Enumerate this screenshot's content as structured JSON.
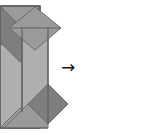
{
  "diagram": {
    "type": "paper-folding-step-diagram",
    "background_color": "#ffffff",
    "arrow": {
      "glyph": "→",
      "label": "folds into",
      "color": "#141414",
      "x": 57,
      "y": 57
    },
    "palette": {
      "light_gray": "#afafaf",
      "mid_gray": "#9a9a9a",
      "dark_gray": "#7e7e7e",
      "edge_stroke": "#6c6c6c",
      "outline_stroke": "#5f5f5f"
    },
    "steps": [
      {
        "id": "before",
        "label": "Unfolded rectangular sheet with top envelope flaps and bottom corner flap",
        "origin_x": 0,
        "origin_y": 0,
        "width": 44,
        "height": 135,
        "shapes": [
          {
            "name": "body-panel",
            "kind": "rect",
            "fill": "#afafaf",
            "points": "0,6 40,6 40,128 0,128"
          },
          {
            "name": "top-left-flap",
            "kind": "triangle",
            "fill": "#9a9a9a",
            "points": "0,6 20,26 0,46"
          },
          {
            "name": "top-right-flap",
            "kind": "triangle",
            "fill": "#9a9a9a",
            "points": "40,6 20,26 40,46"
          },
          {
            "name": "top-upper-flap",
            "kind": "triangle",
            "fill": "#9a9a9a",
            "points": "0,6 40,6 20,26"
          },
          {
            "name": "center-chevron-flap",
            "kind": "chevron",
            "fill": "#7e7e7e",
            "points": "0,6 20,26 40,6 40,42 20,62 0,42"
          },
          {
            "name": "bottom-corner-flap",
            "kind": "triangle",
            "fill": "#9a9a9a",
            "points": "0,128 20,108 40,128"
          }
        ]
      },
      {
        "id": "after",
        "label": "Folded column with diamond head and dark kite foot",
        "origin_x": 75,
        "origin_y": 0,
        "width": 70,
        "height": 135,
        "shapes": [
          {
            "name": "column-panel",
            "kind": "rect",
            "fill": "#afafaf",
            "points": "22,22 48,22 48,112 22,112"
          },
          {
            "name": "head-diamond-upper",
            "kind": "triangle",
            "fill": "#9a9a9a",
            "points": "35,7 61,28 9,28"
          },
          {
            "name": "head-diamond-lower",
            "kind": "triangle",
            "fill": "#9a9a9a",
            "points": "9,28 61,28 35,50"
          },
          {
            "name": "foot-triangle",
            "kind": "triangle",
            "fill": "#9a9a9a",
            "points": "4,128 48,84 48,128"
          },
          {
            "name": "foot-dark-kite",
            "kind": "quad",
            "fill": "#7e7e7e",
            "points": "48,84 68,104 48,124 28,104"
          }
        ]
      }
    ]
  }
}
